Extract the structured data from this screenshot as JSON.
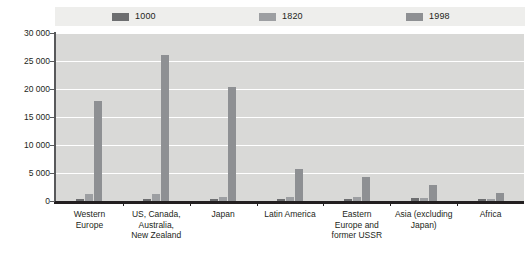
{
  "chart_data": {
    "type": "bar",
    "title": "",
    "subtitle": "",
    "xlabel": "",
    "ylabel": "",
    "ylim": [
      0,
      30000
    ],
    "ytick_values": [
      0,
      5000,
      10000,
      15000,
      20000,
      25000,
      30000
    ],
    "ytick_labels": [
      "0",
      "5 000",
      "10 000",
      "15 000",
      "20 000",
      "25 000",
      "30 000"
    ],
    "grid": true,
    "legend_position": "top",
    "categories": [
      "Western Europe",
      "US, Canada, Australia, New Zealand",
      "Japan",
      "Latin America",
      "Eastern Europe and former USSR",
      "Asia (excluding Japan)",
      "Africa"
    ],
    "category_label_lines": [
      [
        "Western",
        "Europe"
      ],
      [
        "US, Canada,",
        "Australia,",
        "New Zealand"
      ],
      [
        "Japan"
      ],
      [
        "Latin America"
      ],
      [
        "Eastern",
        "Europe and",
        "former USSR"
      ],
      [
        "Asia (excluding",
        "Japan)"
      ],
      [
        "Africa"
      ]
    ],
    "series": [
      {
        "name": "1000",
        "color": "#6d6e70",
        "values": [
          400,
          400,
          425,
          400,
          400,
          450,
          425
        ]
      },
      {
        "name": "1820",
        "color": "#9d9fa2",
        "values": [
          1232,
          1201,
          669,
          665,
          667,
          575,
          418
        ]
      },
      {
        "name": "1998",
        "color": "#8e9093",
        "values": [
          17921,
          26146,
          20410,
          5795,
          4354,
          2936,
          1368
        ]
      }
    ]
  },
  "legend": {
    "entries": [
      {
        "label": "1000",
        "color": "#6d6e70"
      },
      {
        "label": "1820",
        "color": "#9d9fa2"
      },
      {
        "label": "1998",
        "color": "#8e9093"
      }
    ],
    "band_color": "#eeeeec"
  },
  "colors": {
    "plot_background": "#d9d9d7",
    "gridline": "#ffffff",
    "axis": "#231f20",
    "text": "#231f20"
  }
}
